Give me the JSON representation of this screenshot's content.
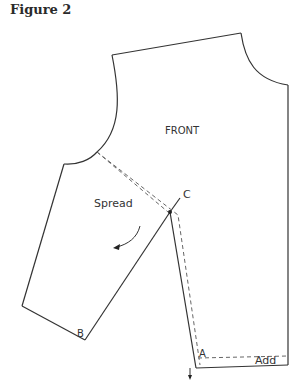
{
  "figure": {
    "title": "Figure 2"
  },
  "diagram": {
    "piece_label": "FRONT",
    "annotations": {
      "spread": "Spread",
      "point_a": "A",
      "point_b": "B",
      "point_c": "C",
      "add": "Add"
    },
    "colors": {
      "line": "#333333",
      "dashed": "#666666",
      "background": "#ffffff"
    }
  }
}
